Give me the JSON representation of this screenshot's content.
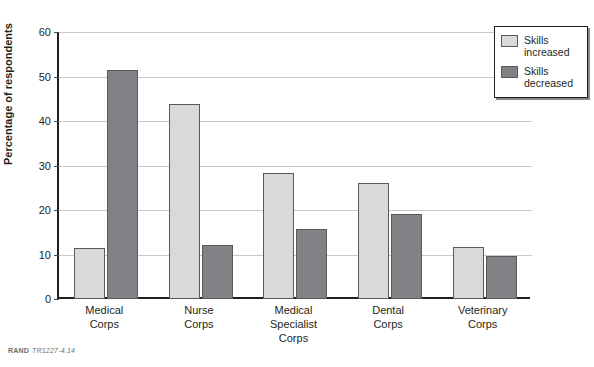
{
  "figure": {
    "clipped_title_fragment": "",
    "footer_source": "RAND",
    "footer_figure_number": "TR1227-4.14"
  },
  "legend": {
    "position": "top-right",
    "entries": [
      {
        "label_line1": "Skills",
        "label_line2": "increased",
        "color": "#d9d9d9"
      },
      {
        "label_line1": "Skills",
        "label_line2": "decreased",
        "color": "#808285"
      }
    ]
  },
  "axis": {
    "y_title": "Percentage of respondents",
    "y_ticks": [
      "0",
      "10",
      "20",
      "30",
      "40",
      "50",
      "60"
    ]
  },
  "categories_wrapped": [
    {
      "line1": "Medical",
      "line2": "Corps",
      "line3": ""
    },
    {
      "line1": "Nurse",
      "line2": "Corps",
      "line3": ""
    },
    {
      "line1": "Medical",
      "line2": "Specialist",
      "line3": "Corps"
    },
    {
      "line1": "Dental",
      "line2": "Corps",
      "line3": ""
    },
    {
      "line1": "Veterinary",
      "line2": "Corps",
      "line3": ""
    }
  ],
  "chart_data": {
    "type": "bar",
    "title": "",
    "xlabel": "",
    "ylabel": "Percentage of respondents",
    "ylim": [
      0,
      60
    ],
    "ytick_step": 10,
    "grid": true,
    "legend_position": "top-right",
    "categories": [
      "Medical Corps",
      "Nurse Corps",
      "Medical Specialist Corps",
      "Dental Corps",
      "Veterinary Corps"
    ],
    "series": [
      {
        "name": "Skills increased",
        "color": "#d9d9d9",
        "values": [
          11.5,
          43.8,
          28.3,
          26.1,
          11.7
        ]
      },
      {
        "name": "Skills decreased",
        "color": "#808285",
        "values": [
          51.5,
          12.1,
          15.7,
          19.1,
          9.7
        ]
      }
    ]
  }
}
